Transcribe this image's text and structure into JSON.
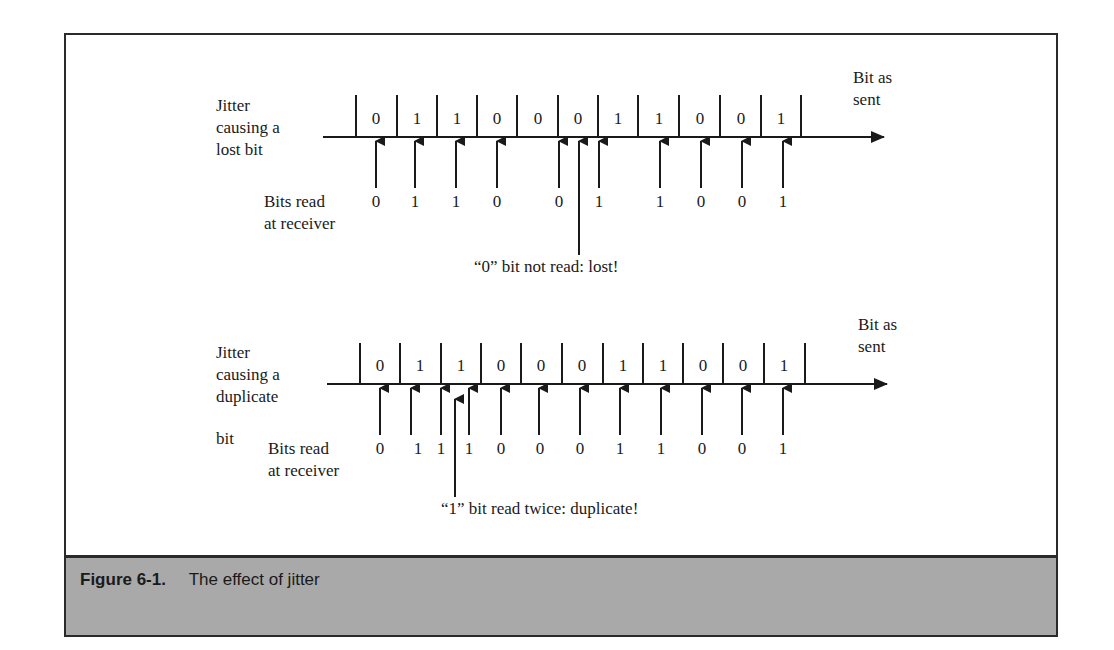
{
  "figure": {
    "number": "Figure 6-1.",
    "caption": "The effect of jitter",
    "colors": {
      "ink": "#1a1a1a",
      "frame": "#2a2a2a",
      "caption_bar": "#a9a9a9",
      "background": "#ffffff"
    }
  },
  "panels": [
    {
      "id": "lost",
      "side_label": [
        "Jitter",
        "causing a",
        "lost bit"
      ],
      "axis_label": [
        "Bit as",
        "sent"
      ],
      "receiver_label": [
        "Bits read",
        "at receiver"
      ],
      "bits_sent": [
        "0",
        "1",
        "1",
        "0",
        "0",
        "0",
        "1",
        "1",
        "0",
        "0",
        "1"
      ],
      "bits_read": [
        "0",
        "1",
        "1",
        "0",
        "0",
        "1",
        "1",
        "0",
        "0",
        "1"
      ],
      "annotation": "“0” bit not read: lost!"
    },
    {
      "id": "duplicate",
      "side_label": [
        "Jitter",
        "causing a",
        "duplicate",
        "bit"
      ],
      "axis_label": [
        "Bit as",
        "sent"
      ],
      "receiver_label": [
        "Bits read",
        "at receiver"
      ],
      "bits_sent": [
        "0",
        "1",
        "1",
        "0",
        "0",
        "0",
        "1",
        "1",
        "0",
        "0",
        "1"
      ],
      "bits_read": [
        "0",
        "1",
        "1",
        "1",
        "0",
        "0",
        "0",
        "1",
        "1",
        "0",
        "0",
        "1"
      ],
      "annotation": "“1” bit read twice: duplicate!"
    }
  ]
}
